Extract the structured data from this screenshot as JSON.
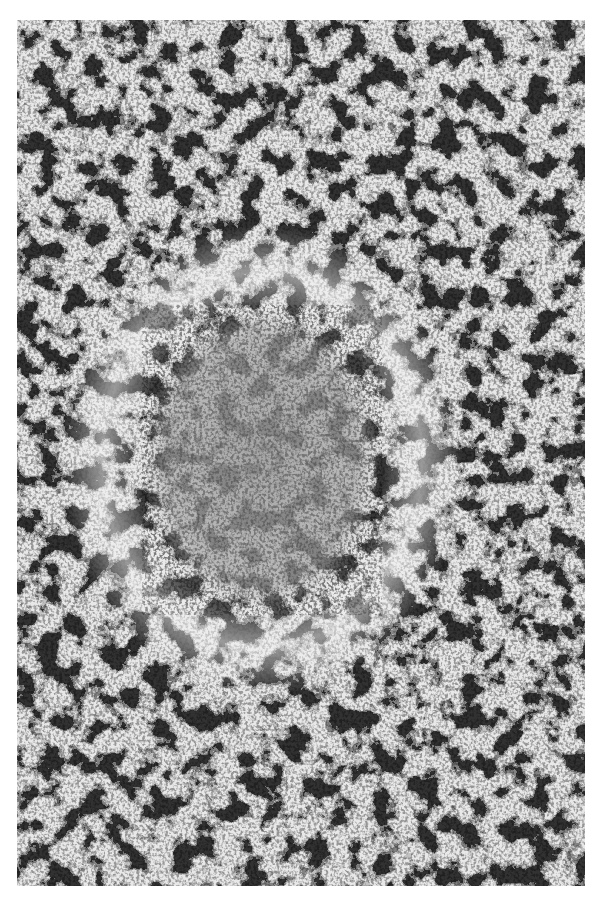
{
  "figure": {
    "type": "histology-micrograph",
    "color_mode": "grayscale",
    "caption": "",
    "colors": {
      "background": "#ffffff",
      "tissue_light": "#e6e6e6",
      "tissue_mid": "#8a8a8a",
      "tissue_dark": "#2a2a2a",
      "nodule_tone": "#9c9c9c"
    },
    "regions": {
      "central_nodule": {
        "cx": 250,
        "cy": 440,
        "rx": 110,
        "ry": 150
      }
    }
  }
}
